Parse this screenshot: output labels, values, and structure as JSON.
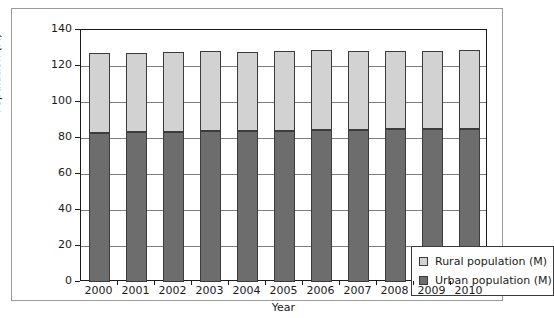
{
  "chart_data": {
    "type": "bar",
    "stacked": true,
    "title": "",
    "xlabel": "Year",
    "ylabel": "Population (M)",
    "categories": [
      "2000",
      "2001",
      "2002",
      "2003",
      "2004",
      "2005",
      "2006",
      "2007",
      "2008",
      "2009",
      "2010"
    ],
    "series": [
      {
        "name": "Urban population (M)",
        "color": "#6d6d6d",
        "values": [
          83,
          83.4,
          83.6,
          83.9,
          83.9,
          84.1,
          84.4,
          84.5,
          85.0,
          85.0,
          85.2
        ]
      },
      {
        "name": "Rural population (M)",
        "color": "#d2d2d2",
        "values": [
          44.4,
          44.1,
          44.0,
          44.4,
          44.1,
          44.2,
          44.4,
          43.9,
          43.6,
          43.6,
          43.5
        ]
      }
    ],
    "totals": [
      127.4,
      127.5,
      127.6,
      128.3,
      128.0,
      128.3,
      128.8,
      128.4,
      128.6,
      128.6,
      128.7
    ],
    "ylim": [
      0,
      140
    ],
    "yticks": [
      0,
      20,
      40,
      60,
      80,
      100,
      120,
      140
    ],
    "ytick_labels": [
      "0",
      "20",
      "40",
      "60",
      "80",
      "100",
      "120",
      "140"
    ],
    "grid": true,
    "grid_axis": "y",
    "legend_position": "lower right",
    "legend_entries": [
      {
        "label": "Rural population (M)",
        "color": "#d2d2d2"
      },
      {
        "label": "Urban population (M)",
        "color": "#6d6d6d"
      }
    ]
  }
}
